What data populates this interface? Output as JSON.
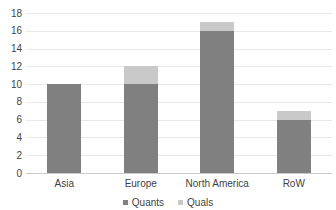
{
  "chart_data": {
    "type": "bar",
    "subtype": "stacked-column",
    "title": "",
    "subtitle": "",
    "xlabel": "",
    "ylabel": "",
    "categories": [
      "Asia",
      "Europe",
      "North America",
      "RoW"
    ],
    "series": [
      {
        "name": "Quants",
        "color": "#808080",
        "values": [
          10,
          10,
          16,
          6
        ]
      },
      {
        "name": "Quals",
        "color": "#c9c9c9",
        "values": [
          0,
          2,
          1,
          1
        ]
      }
    ],
    "totals": [
      10,
      12,
      17,
      7
    ],
    "ylim": [
      0,
      18
    ],
    "ytick_step": 2,
    "yticks": [
      18,
      16,
      14,
      12,
      10,
      8,
      6,
      4,
      2,
      0
    ],
    "ytick_labels": [
      "18",
      "16",
      "14",
      "12",
      "10",
      "8",
      "6",
      "4",
      "2",
      "0"
    ],
    "grid": {
      "horizontal": true,
      "vertical": false,
      "color": "#e8e8e8"
    },
    "legend": {
      "position": "bottom",
      "entries": [
        {
          "label": "Quants",
          "color": "#808080"
        },
        {
          "label": "Quals",
          "color": "#c9c9c9"
        }
      ]
    },
    "background": "#ffffff",
    "axis_text_color": "#3f3f3f"
  }
}
